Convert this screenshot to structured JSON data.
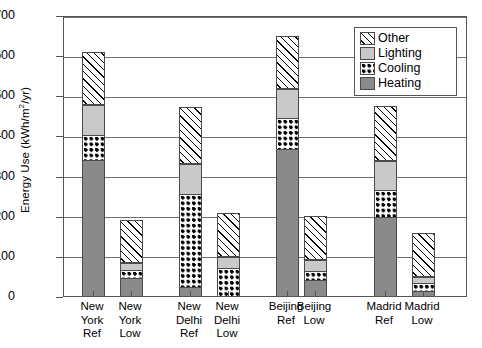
{
  "chart_data": {
    "type": "bar",
    "subtype": "stacked-vertical",
    "title": "",
    "xlabel": "",
    "ylabel": "Energy Use (kWh/m2/yr)",
    "ylabel_parts": {
      "pre": "Energy Use (kWh/m",
      "sup": "2",
      "post": "/yr)"
    },
    "ylim": [
      0,
      700
    ],
    "yticks": [
      0,
      100,
      200,
      300,
      400,
      500,
      600,
      700
    ],
    "ytick_labels": [
      "0",
      "100",
      "200",
      "300",
      "400",
      "500",
      "600",
      "700"
    ],
    "grid": true,
    "grid_axis": "y",
    "legend_position": "top-right",
    "categories": [
      "New York Ref",
      "New York Low",
      "New Delhi Ref",
      "New Delhi Low",
      "Beijing Ref",
      "Beijing Low",
      "Madrid Ref",
      "Madrid Low"
    ],
    "category_label_lines": [
      [
        "New",
        "York",
        "Ref"
      ],
      [
        "New",
        "York",
        "Low"
      ],
      [
        "New",
        "Delhi",
        "Ref"
      ],
      [
        "New",
        "Delhi",
        "Low"
      ],
      [
        "Beijing",
        "Ref",
        ""
      ],
      [
        "Beijing",
        "Low",
        ""
      ],
      [
        "Madrid",
        "Ref",
        ""
      ],
      [
        "Madrid",
        "Low",
        ""
      ]
    ],
    "stack_order_bottom_to_top": [
      "Heating",
      "Cooling",
      "Lighting",
      "Other"
    ],
    "series": [
      {
        "name": "Heating",
        "pattern": "solid-dark-gray",
        "color": "#8a8a8a",
        "values": [
          340,
          45,
          22,
          0,
          365,
          40,
          197,
          12
        ]
      },
      {
        "name": "Cooling",
        "pattern": "dotted-checker",
        "color": "#ffffff",
        "values": [
          60,
          20,
          233,
          70,
          78,
          22,
          68,
          20
        ]
      },
      {
        "name": "Lighting",
        "pattern": "solid-light-gray",
        "color": "#c9c9c9",
        "values": [
          77,
          17,
          75,
          26,
          72,
          28,
          72,
          16
        ]
      },
      {
        "name": "Other",
        "pattern": "diagonal-hatch",
        "color": "#ffffff",
        "values": [
          130,
          108,
          142,
          110,
          133,
          110,
          137,
          108
        ]
      }
    ],
    "totals": [
      607,
      190,
      472,
      206,
      648,
      200,
      474,
      156
    ]
  },
  "legend": {
    "items": [
      {
        "label": "Other"
      },
      {
        "label": "Lighting"
      },
      {
        "label": "Cooling"
      },
      {
        "label": "Heating"
      }
    ]
  }
}
